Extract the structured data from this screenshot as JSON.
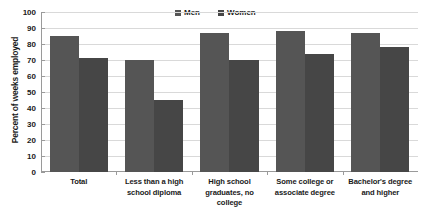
{
  "chart_data": {
    "type": "bar",
    "title": "",
    "xlabel": "",
    "ylabel": "Percent of weeks employed",
    "ylim": [
      0,
      100
    ],
    "ytick_step": 10,
    "yticks": [
      100,
      90,
      80,
      70,
      60,
      50,
      40,
      30,
      20,
      10,
      0
    ],
    "grid": true,
    "legend_position": "top-center",
    "categories": [
      "Total",
      "Less than a high school diploma",
      "High school graduates, no college",
      "Some college or associate degree",
      "Bachelor's degree and higher"
    ],
    "category_lines": [
      [
        "Total"
      ],
      [
        "Less than a high",
        "school diploma"
      ],
      [
        "High school",
        "graduates, no",
        "college"
      ],
      [
        "Some college or",
        "associate degree"
      ],
      [
        "Bachelor's degree",
        "and higher"
      ]
    ],
    "series": [
      {
        "name": "Men",
        "color": "#555555",
        "values": [
          85,
          70,
          87,
          88,
          87
        ]
      },
      {
        "name": "Women",
        "color": "#464646",
        "values": [
          71,
          45,
          70,
          74,
          78
        ]
      }
    ]
  },
  "legend": {
    "items": [
      {
        "label": "Men",
        "color": "#555555",
        "marker": "square-swatch"
      },
      {
        "label": "Women",
        "color": "#464646",
        "marker": "square-swatch"
      }
    ]
  }
}
